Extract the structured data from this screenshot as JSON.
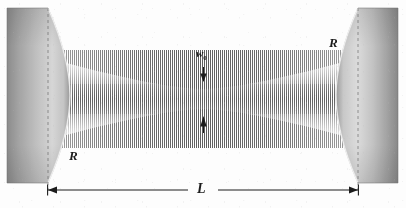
{
  "figure": {
    "type": "optics-diagram",
    "background_color": "#fdfdfd",
    "ink_color": "#1c1c1c"
  },
  "labels": {
    "radius_top_right": "R",
    "radius_bottom_left": "R",
    "cavity_length": "L",
    "beam_waist": "w",
    "beam_waist_sub": "0"
  },
  "elements": {
    "left_mirror": {
      "name": "left-mirror",
      "x": 7,
      "y": 8,
      "width": 41,
      "height": 175,
      "surface": "concave",
      "fill_dark": "#888888",
      "fill_light": "#e9e9e9"
    },
    "right_mirror": {
      "name": "right-mirror",
      "x": 358,
      "y": 8,
      "width": 40,
      "height": 175,
      "surface": "concave",
      "fill_dark": "#8a8a8a",
      "fill_light": "#ececec"
    },
    "beam": {
      "name": "gaussian-beam",
      "waist_x": 203,
      "waist_half_height": 10,
      "edge_half_height": 40,
      "fringe_color": "#7a7a7a",
      "description": "standing-wave fringes inside gaussian envelope"
    },
    "dimension_line": {
      "name": "cavity-length-dimension",
      "y": 190,
      "x_start": 48,
      "x_end": 358,
      "arrowheads": "both"
    },
    "waist_arrow_top": {
      "name": "waist-arrow-down",
      "x": 203,
      "y_from": 68,
      "y_to": 81
    },
    "waist_arrow_bottom": {
      "name": "waist-arrow-up",
      "x": 203,
      "y_from": 133,
      "y_to": 117
    },
    "dashed_guide_left": {
      "name": "left-mirror-vertex-guide",
      "x": 48,
      "y_from": 8,
      "y_to": 190
    },
    "dashed_guide_right": {
      "name": "right-mirror-vertex-guide",
      "x": 358,
      "y_from": 8,
      "y_to": 190
    }
  }
}
